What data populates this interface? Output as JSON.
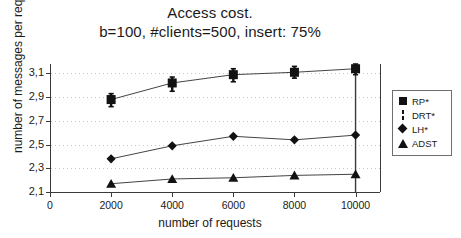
{
  "chart_data": {
    "type": "line",
    "title": "Access cost.",
    "subtitle": "b=100, #clients=500, insert: 75%",
    "xlabel": "number of requests",
    "ylabel": "number of messages per request",
    "x": [
      2000,
      4000,
      6000,
      8000,
      10000
    ],
    "xlim": [
      0,
      10800
    ],
    "ylim": [
      2.1,
      3.18
    ],
    "xticks": [
      0,
      2000,
      4000,
      6000,
      8000,
      10000
    ],
    "xtick_labels": [
      "0",
      "2000",
      "4000",
      "6000",
      "8000",
      "10000"
    ],
    "yticks": [
      2.1,
      2.3,
      2.5,
      2.7,
      2.9,
      3.1
    ],
    "ytick_labels": [
      "2,1",
      "2,3",
      "2,5",
      "2,7",
      "2,9",
      "3,1"
    ],
    "grid": "horizontal-dotted",
    "legend_position": "right",
    "series": [
      {
        "name": "RP*",
        "marker": "square",
        "values": [
          2.88,
          3.02,
          3.09,
          3.11,
          3.14
        ],
        "errors_low": [
          2.82,
          2.95,
          3.03,
          3.06,
          3.09
        ],
        "errors_high": [
          2.93,
          3.07,
          3.14,
          3.16,
          3.18
        ]
      },
      {
        "name": "DRT*",
        "marker": "vertical-bar",
        "values": [
          null,
          null,
          null,
          null,
          2.62
        ],
        "note": "error-bar style series drawn as vertical whiskers"
      },
      {
        "name": "LH*",
        "marker": "diamond",
        "values": [
          2.38,
          2.49,
          2.57,
          2.54,
          2.58
        ]
      },
      {
        "name": "ADST",
        "marker": "triangle",
        "values": [
          2.17,
          2.21,
          2.22,
          2.24,
          2.25
        ]
      }
    ]
  },
  "legend": {
    "items": [
      {
        "label": "RP*",
        "marker": "square"
      },
      {
        "label": "DRT*",
        "marker": "vertical-bar"
      },
      {
        "label": "LH*",
        "marker": "diamond"
      },
      {
        "label": "ADST",
        "marker": "triangle"
      }
    ]
  },
  "colors": {
    "ink": "#121212",
    "axis": "#3b3b3b",
    "grid": "#bdbdbd",
    "background": "#ffffff"
  }
}
